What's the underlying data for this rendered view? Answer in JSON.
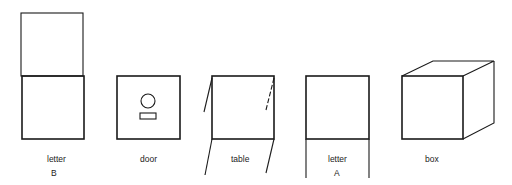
{
  "figure": {
    "items": [
      {
        "id": "letter-b",
        "label": "letter",
        "sublabel": "B"
      },
      {
        "id": "door",
        "label": "door"
      },
      {
        "id": "table",
        "label": "table"
      },
      {
        "id": "letter-a",
        "label": "letter",
        "sublabel": "A"
      },
      {
        "id": "box",
        "label": "box"
      }
    ],
    "stroke_color": "#1a1a1a",
    "background": "#ffffff"
  }
}
